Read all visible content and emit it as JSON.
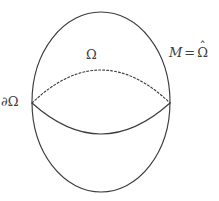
{
  "figure": {
    "kind": "geometric-diagram",
    "background_color": "#ffffff",
    "stroke_color": "#3c3c3c",
    "label_color": "#3c3c3c",
    "stroke_width": 1.1,
    "canvas": {
      "width": 219,
      "height": 201
    }
  },
  "shapes": {
    "outer_ellipse": {
      "name": "outer-ellipse",
      "cx": 101,
      "cy": 102,
      "rx": 69,
      "ry": 90,
      "style": "solid"
    },
    "upper_arc": {
      "name": "dashed-upper-arc",
      "style": "dashed",
      "dash_pattern": "2 2",
      "start": {
        "x": 32,
        "y": 103
      },
      "end": {
        "x": 170,
        "y": 103
      },
      "apex": {
        "x": 101,
        "y": 70
      }
    },
    "lower_arc": {
      "name": "solid-lower-arc",
      "style": "solid",
      "start": {
        "x": 32,
        "y": 103
      },
      "end": {
        "x": 170,
        "y": 103
      },
      "apex": {
        "x": 101,
        "y": 134
      }
    },
    "intersection_points": [
      {
        "name": "left-vertex",
        "x": 32,
        "y": 103
      },
      {
        "name": "right-vertex",
        "x": 170,
        "y": 103
      }
    ]
  },
  "labels": {
    "interior_region": {
      "text": "Ω",
      "description": "Omega",
      "x": 93,
      "y": 57
    },
    "boundary": {
      "partial": "∂",
      "omega": "Ω",
      "text": "∂Ω",
      "description": "partial Omega",
      "x": 14,
      "y": 103
    },
    "manifold": {
      "m": "M",
      "equals": "=",
      "omega": "Ω",
      "hat": "ˆ",
      "text": "M = Ω̂",
      "description": "M equals Omega hat",
      "x": 191,
      "y": 55
    }
  }
}
